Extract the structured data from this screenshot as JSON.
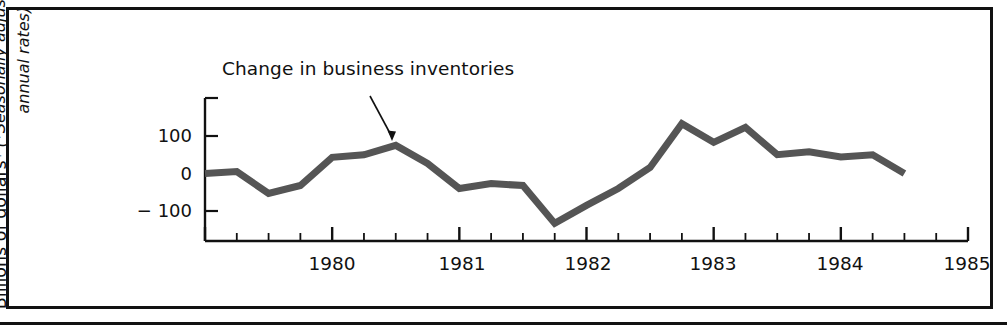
{
  "figure": {
    "annotation_label": "Change in business inventories",
    "y_axis_title_line1": "Billions of dollars*",
    "y_axis_title_line2": "(*Seasonally adjusted",
    "y_axis_title_line3": "annual rates)"
  },
  "chart_data": {
    "type": "line",
    "title": "Change in business inventories",
    "xlabel": "",
    "ylabel": "Billions of dollars* (*Seasonally adjusted annual rates)",
    "ylim": [
      -200,
      150
    ],
    "yticks": [
      100,
      0,
      -100
    ],
    "ytick_labels": [
      "100",
      "0",
      "− 100"
    ],
    "xlim": [
      1979.0,
      1985.0
    ],
    "xticks": [
      1980,
      1981,
      1982,
      1983,
      1984,
      1985
    ],
    "xtick_labels": [
      "1980",
      "1981",
      "1982",
      "1983",
      "1984",
      "1985"
    ],
    "minor_xticks_per_year": 4,
    "grid": false,
    "legend": "none",
    "line_color": "#555555",
    "line_width": 7,
    "annotations": [
      {
        "text": "Change in business inventories",
        "arrow_from_x": 1979.75,
        "arrow_from_y": 140,
        "arrow_to_x": 1980.5,
        "arrow_to_y": 60
      }
    ],
    "x": [
      1979.0,
      1979.25,
      1979.5,
      1979.75,
      1980.0,
      1980.25,
      1980.5,
      1980.75,
      1981.0,
      1981.25,
      1981.5,
      1981.75,
      1982.0,
      1982.25,
      1982.5,
      1982.75,
      1983.0,
      1983.25,
      1983.5,
      1983.75,
      1984.0,
      1984.25,
      1984.5
    ],
    "values": [
      0,
      5,
      -53,
      -32,
      43,
      50,
      75,
      27,
      -40,
      -27,
      -32,
      -133,
      -85,
      -40,
      16,
      133,
      83,
      123,
      50,
      58,
      44,
      50,
      0
    ],
    "series": [
      {
        "name": "Change in business inventories",
        "values": [
          0,
          5,
          -53,
          -32,
          43,
          50,
          75,
          27,
          -40,
          -27,
          -32,
          -133,
          -85,
          -40,
          16,
          133,
          83,
          123,
          50,
          58,
          44,
          50,
          0
        ]
      }
    ]
  }
}
